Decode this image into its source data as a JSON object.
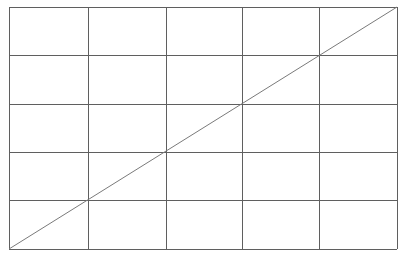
{
  "diagram": {
    "type": "grid-with-diagonal",
    "columns": 5,
    "rows": 5,
    "x_lines": [
      9,
      88,
      166,
      242,
      319,
      397
    ],
    "y_lines": [
      7,
      55,
      104,
      152,
      200,
      249
    ],
    "diagonal": {
      "x1": 9,
      "y1": 249,
      "x2": 397,
      "y2": 7
    },
    "colors": {
      "background": "#ffffff",
      "grid_line": "#5f5f5f",
      "diagonal_line": "#7a7a7a"
    }
  }
}
